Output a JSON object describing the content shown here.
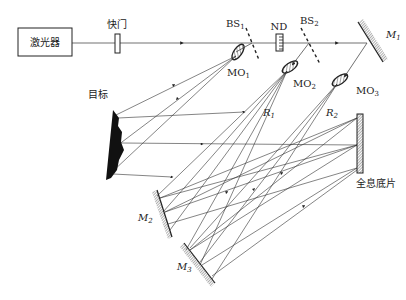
{
  "components": {
    "laser": {
      "label": "激光器"
    },
    "shutter": {
      "label": "快门"
    },
    "bs1": {
      "label": "BS",
      "sub": "1"
    },
    "nd": {
      "label": "ND"
    },
    "bs2": {
      "label": "BS",
      "sub": "2"
    },
    "m1": {
      "label": "M",
      "sub": "1"
    },
    "mo1": {
      "label": "MO",
      "sub": "1"
    },
    "mo2": {
      "label": "MO",
      "sub": "2"
    },
    "mo3": {
      "label": "MO",
      "sub": "3"
    },
    "target": {
      "label": "目标"
    },
    "r1": {
      "label": "R",
      "sub": "1"
    },
    "r2": {
      "label": "R",
      "sub": "2"
    },
    "hologram": {
      "label": "全息底片"
    },
    "m2": {
      "label": "M",
      "sub": "2"
    },
    "m3": {
      "label": "M",
      "sub": "3"
    }
  },
  "colors": {
    "line": "#333333",
    "fill": "#111111",
    "background": "#ffffff"
  }
}
